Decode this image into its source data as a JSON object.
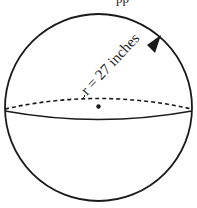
{
  "figure": {
    "top_clipped_text": "pp",
    "radius_label": "r = 27 inches",
    "shape": "sphere",
    "stroke_color": "#1a1a1a",
    "background": "#ffffff"
  }
}
